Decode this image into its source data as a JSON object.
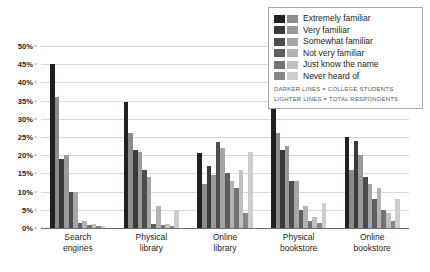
{
  "chart_data": {
    "type": "bar",
    "title": "",
    "subtitle": "",
    "xlabel": "",
    "ylabel": "",
    "ylim": [
      0,
      50
    ],
    "ytick_labels": [
      "0%",
      "5%",
      "10%",
      "15%",
      "20%",
      "25%",
      "30%",
      "35%",
      "40%",
      "45%",
      "50%"
    ],
    "ytick_values": [
      0,
      5,
      10,
      15,
      20,
      25,
      30,
      35,
      40,
      45,
      50
    ],
    "grid": true,
    "legend_position": "top-right",
    "categories": [
      "Search engines",
      "Physical library",
      "Online library",
      "Physical bookstore",
      "Online bookstore"
    ],
    "category_lines": [
      [
        "Search",
        "engines"
      ],
      [
        "Physical",
        "library"
      ],
      [
        "Online",
        "library"
      ],
      [
        "Physical",
        "bookstore"
      ],
      [
        "Online",
        "bookstore"
      ]
    ],
    "group_names": [
      "College students",
      "Total respondents"
    ],
    "series": [
      {
        "name": "Extremely familiar",
        "color_dark": "#231f20",
        "color_light": "#8c8c8c",
        "values_dark": [
          45,
          34.5,
          20.5,
          36,
          25
        ],
        "values_light": [
          36,
          26,
          12,
          26,
          16
        ]
      },
      {
        "name": "Very familiar",
        "color_dark": "#3a3a3a",
        "color_light": "#9a9a9a",
        "values_dark": [
          19,
          21.5,
          17,
          21.5,
          24
        ],
        "values_light": [
          20,
          21,
          14.5,
          22.5,
          20
        ]
      },
      {
        "name": "Somewhat familiar",
        "color_dark": "#4d4d4d",
        "color_light": "#a6a6a6",
        "values_dark": [
          10,
          16,
          23.5,
          13,
          14
        ]
      },
      {
        "name": "Not very familiar",
        "color_dark": "#5f5f5f",
        "color_light": "#b3b3b3",
        "values_dark": [
          1.5,
          1,
          15,
          5,
          8
        ]
      },
      {
        "name": "Just know the name",
        "color_dark": "#737373",
        "color_light": "#c0c0c0",
        "values_dark": [
          0.8,
          0.8,
          11,
          2,
          5
        ]
      },
      {
        "name": "Never heard of",
        "color_dark": "#868686",
        "color_light": "#cccccc",
        "values_dark": [
          0.5,
          0.5,
          4,
          1.5,
          2
        ]
      }
    ],
    "bars": [
      {
        "category": "Search engines",
        "pairs": [
          {
            "series": "Extremely familiar",
            "dark": 45,
            "light": 36
          },
          {
            "series": "Very familiar",
            "dark": 19,
            "light": 20
          },
          {
            "series": "Somewhat familiar",
            "dark": 10,
            "light": 10
          },
          {
            "series": "Not very familiar",
            "dark": 1.5,
            "light": 2
          },
          {
            "series": "Just know the name",
            "dark": 0.8,
            "light": 1
          },
          {
            "series": "Never heard of",
            "dark": 0.5,
            "light": 0.6
          }
        ]
      },
      {
        "category": "Physical library",
        "pairs": [
          {
            "series": "Extremely familiar",
            "dark": 34.5,
            "light": 26
          },
          {
            "series": "Very familiar",
            "dark": 21.5,
            "light": 21
          },
          {
            "series": "Somewhat familiar",
            "dark": 16,
            "light": 14
          },
          {
            "series": "Not very familiar",
            "dark": 1,
            "light": 6
          },
          {
            "series": "Just know the name",
            "dark": 0.8,
            "light": 1
          },
          {
            "series": "Never heard of",
            "dark": 0.5,
            "light": 5
          }
        ]
      },
      {
        "category": "Online library",
        "pairs": [
          {
            "series": "Extremely familiar",
            "dark": 20.5,
            "light": 12
          },
          {
            "series": "Very familiar",
            "dark": 17,
            "light": 14.5
          },
          {
            "series": "Somewhat familiar",
            "dark": 23.5,
            "light": 22
          },
          {
            "series": "Not very familiar",
            "dark": 15,
            "light": 13
          },
          {
            "series": "Just know the name",
            "dark": 11,
            "light": 16
          },
          {
            "series": "Never heard of",
            "dark": 4,
            "light": 21
          }
        ]
      },
      {
        "category": "Physical bookstore",
        "pairs": [
          {
            "series": "Extremely familiar",
            "dark": 36,
            "light": 26
          },
          {
            "series": "Very familiar",
            "dark": 21.5,
            "light": 22.5
          },
          {
            "series": "Somewhat familiar",
            "dark": 13,
            "light": 13
          },
          {
            "series": "Not very familiar",
            "dark": 5,
            "light": 6
          },
          {
            "series": "Just know the name",
            "dark": 2,
            "light": 3
          },
          {
            "series": "Never heard of",
            "dark": 1.5,
            "light": 7
          }
        ]
      },
      {
        "category": "Online bookstore",
        "pairs": [
          {
            "series": "Extremely familiar",
            "dark": 25,
            "light": 16
          },
          {
            "series": "Very familiar",
            "dark": 24,
            "light": 20
          },
          {
            "series": "Somewhat familiar",
            "dark": 14,
            "light": 12
          },
          {
            "series": "Not very familiar",
            "dark": 8,
            "light": 11
          },
          {
            "series": "Just know the name",
            "dark": 5,
            "light": 4
          },
          {
            "series": "Never heard of",
            "dark": 2,
            "light": 8
          }
        ]
      }
    ]
  },
  "legend": {
    "items": [
      {
        "label": "Extremely familiar",
        "dark": "#231f20",
        "light": "#8c8c8c"
      },
      {
        "label": "Very familiar",
        "dark": "#3a3a3a",
        "light": "#9a9a9a"
      },
      {
        "label": "Somewhat familiar",
        "dark": "#4d4d4d",
        "light": "#a6a6a6"
      },
      {
        "label": "Not very familiar",
        "dark": "#5f5f5f",
        "light": "#b3b3b3"
      },
      {
        "label": "Just know the name",
        "dark": "#737373",
        "light": "#c0c0c0"
      },
      {
        "label": "Never heard of",
        "dark": "#868686",
        "light": "#cccccc"
      }
    ],
    "note_dark": "DARKER LINES = COLLEGE STUDENTS",
    "note_light": "LIGHTER LINES = TOTAL RESPONDENTS"
  },
  "colors": {
    "grid": "#d9d9d9",
    "axis": "#6d6e71",
    "text": "#231f20",
    "note_text": "#58595b",
    "background": "#ffffff"
  }
}
